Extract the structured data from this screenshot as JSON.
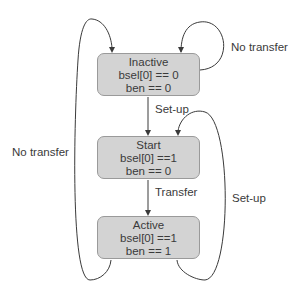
{
  "diagram": {
    "type": "state-machine",
    "states": [
      {
        "id": "inactive",
        "name": "Inactive",
        "conditions": [
          "bsel[0] == 0",
          "ben == 0"
        ]
      },
      {
        "id": "start",
        "name": "Start",
        "conditions": [
          "bsel[0] ==1",
          "ben == 0"
        ]
      },
      {
        "id": "active",
        "name": "Active",
        "conditions": [
          "bsel[0] ==1",
          "ben == 1"
        ]
      }
    ],
    "transitions": [
      {
        "from": "inactive",
        "to": "inactive",
        "label": "No transfer"
      },
      {
        "from": "inactive",
        "to": "start",
        "label": "Set-up"
      },
      {
        "from": "start",
        "to": "active",
        "label": "Transfer"
      },
      {
        "from": "active",
        "to": "start",
        "label": "Set-up"
      },
      {
        "from": "active",
        "to": "inactive",
        "label": "No transfer"
      }
    ],
    "colors": {
      "state_fill": "#d3d3d3",
      "state_border": "#9a9a9a",
      "edge": "#3a3a3a"
    }
  }
}
